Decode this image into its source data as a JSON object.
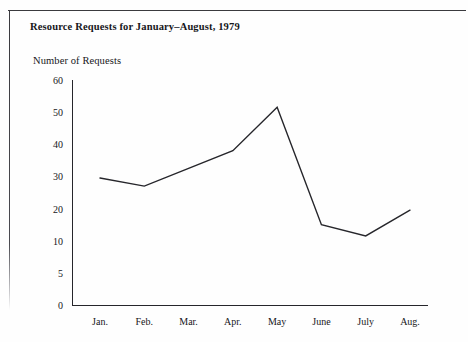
{
  "figure": {
    "title": "Resource Requests for January–August, 1979",
    "y_axis_label": "Number of Requests"
  },
  "chart_data": {
    "type": "line",
    "title": "Resource Requests for January–August, 1979",
    "xlabel": "",
    "ylabel": "Number of Requests",
    "categories": [
      "Jan.",
      "Feb.",
      "Mar.",
      "Apr.",
      "May",
      "June",
      "July",
      "Aug."
    ],
    "values": [
      29.5,
      27,
      32.5,
      38,
      51.5,
      15,
      11.5,
      19.5
    ],
    "y_ticks": [
      0,
      5,
      10,
      20,
      30,
      40,
      50,
      60
    ],
    "y_tick_labels": [
      "0",
      "5",
      "10",
      "20",
      "30",
      "40",
      "50",
      "60"
    ],
    "y_axis_scale": "non-uniform (5 shown as a separate evenly spaced tick between 0 and 10)",
    "ylim": [
      0,
      60
    ],
    "grid": false,
    "legend": null,
    "series": [
      {
        "name": "Number of Requests",
        "values": [
          29.5,
          27,
          32.5,
          38,
          51.5,
          15,
          11.5,
          19.5
        ],
        "color": "#26262b",
        "markers": false
      }
    ]
  },
  "style": {
    "line_color": "#26262b",
    "axis_color": "#26262b",
    "frame_color": "#3a3a3e",
    "background": "#fefefe"
  }
}
